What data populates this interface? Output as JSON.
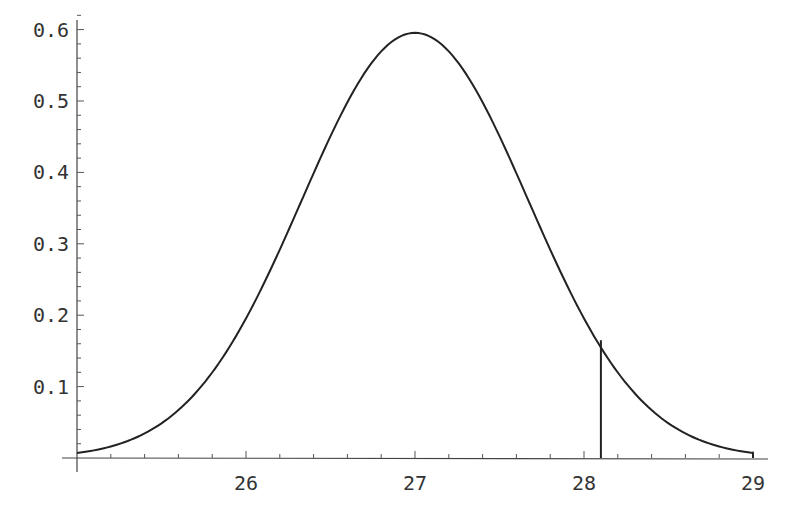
{
  "chart_data": {
    "type": "line",
    "title": "",
    "xlabel": "",
    "ylabel": "",
    "xlim": [
      25,
      29
    ],
    "ylim": [
      0,
      0.6
    ],
    "grid": false,
    "legend": null,
    "x_ticks": [
      26,
      27,
      28,
      29
    ],
    "x_tick_labels": [
      "26",
      "27",
      "28",
      "29"
    ],
    "y_ticks": [
      0.1,
      0.2,
      0.3,
      0.4,
      0.5,
      0.6
    ],
    "y_tick_labels": [
      "0.1",
      "0.2",
      "0.3",
      "0.4",
      "0.5",
      "0.6"
    ],
    "series": [
      {
        "name": "normal density",
        "distribution": {
          "mean": 27,
          "sd": 0.67
        },
        "x": [
          25.0,
          25.25,
          25.5,
          25.75,
          26.0,
          26.25,
          26.5,
          26.75,
          27.0,
          27.25,
          27.5,
          27.75,
          28.0,
          28.25,
          28.5,
          28.75,
          29.0
        ],
        "values": [
          0.007,
          0.019,
          0.048,
          0.104,
          0.196,
          0.319,
          0.451,
          0.553,
          0.595,
          0.553,
          0.451,
          0.319,
          0.196,
          0.104,
          0.048,
          0.019,
          0.007
        ]
      }
    ],
    "annotations": [
      {
        "type": "vertical-line",
        "x": 28.1,
        "y_from": 0,
        "y_to": 0.165
      }
    ]
  },
  "axes": {
    "x_labels": [
      "26",
      "27",
      "28",
      "29"
    ],
    "y_labels": [
      "0.1",
      "0.2",
      "0.3",
      "0.4",
      "0.5",
      "0.6"
    ]
  }
}
